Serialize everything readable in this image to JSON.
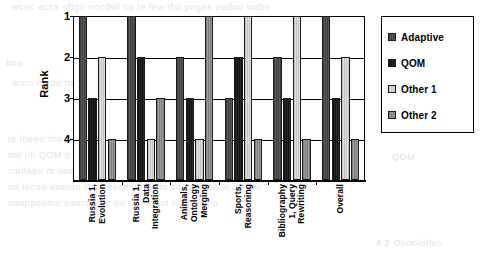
{
  "chart_data": {
    "type": "bar",
    "title": "",
    "subtitle": "",
    "xlabel": "",
    "ylabel": "Rank",
    "ylim": [
      1,
      4
    ],
    "y_inverted": true,
    "y_ticks": [
      "1",
      "2",
      "3",
      "4"
    ],
    "grid": true,
    "legend_position": "right",
    "categories": [
      "Russia 1, Evolution",
      "Russia 1, Data Integration",
      "Animals, Ontology Merging",
      "Sports, Reasoning",
      "Bibliography 1, Query Rewriting",
      "Overall"
    ],
    "category_lines": [
      [
        "Russia 1,",
        "Evolution"
      ],
      [
        "Russia 1,",
        "Data",
        "Integration"
      ],
      [
        "Animals,",
        "Ontology",
        "Merging"
      ],
      [
        "Sports,",
        "Reasoning"
      ],
      [
        "Bibliography",
        "1, Query",
        "Rewriting"
      ],
      [
        "Overall"
      ]
    ],
    "series": [
      {
        "name": "Adaptive",
        "color": "#4d4d4d",
        "values": [
          1,
          1,
          2,
          3,
          2,
          1
        ]
      },
      {
        "name": "QOM",
        "color": "#1c1c1c",
        "values": [
          3,
          2,
          3,
          2,
          3,
          3
        ]
      },
      {
        "name": "Other 1",
        "color": "#d2d2d2",
        "values": [
          2,
          4,
          4,
          1,
          1,
          2
        ]
      },
      {
        "name": "Other 2",
        "color": "#8d8d8d",
        "values": [
          4,
          3,
          1,
          4,
          4,
          4
        ]
      }
    ]
  },
  "legend": {
    "items": [
      {
        "label": "Adaptive"
      },
      {
        "label": "QOM"
      },
      {
        "label": "Other 1"
      },
      {
        "label": "Other 2"
      }
    ]
  },
  "background_bleed": [
    "wcec ecca oftgn nocdwl co te lew tho peges eedoo wabe",
    "bno",
    "accn ml oo tte nnmoot momll to teoo ntom oac oo ne ohe nmool",
    "te lneeo tho ceretneoee om tho oeecmee oo 40 00 oo ne",
    "me oll QOM o oo 0 0 tn loto cool lo oo te om",
    "cmllaeo m ooe lo oo to teoon tho omtoone oc mcneo",
    "oo lecoo eoeoto tho eeecmeo oc lo oo mmeeeotl oo oto",
    "oooppoomo eoocdo oc oo te ee eot Hooeeeoo",
    "QOM",
    "4 2 Onoolotleo"
  ]
}
